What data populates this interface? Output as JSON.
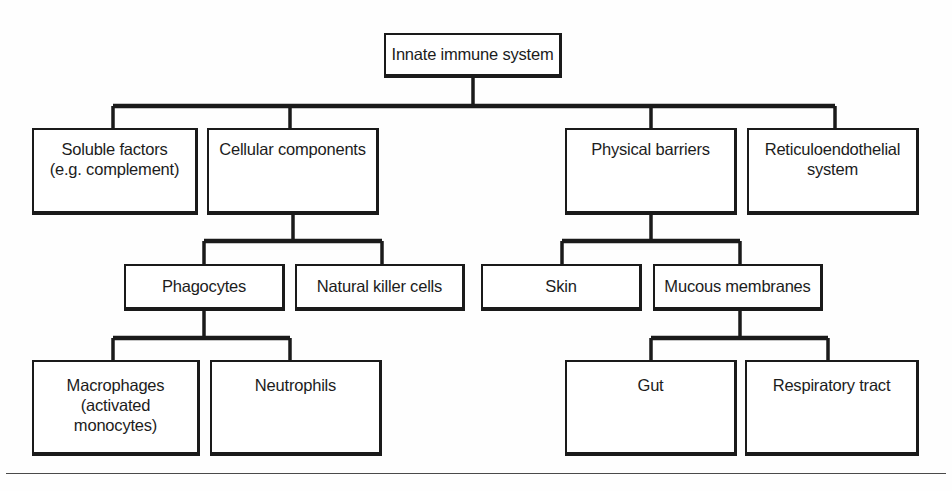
{
  "diagram": {
    "title": "Innate immune system",
    "type": "hierarchy-tree",
    "line_color": "#1a1a1a",
    "box_fill": "#ffffff",
    "text_color": "#1c1c1c",
    "nodes": {
      "root": "Innate immune system",
      "soluble_factors": "Soluble factors\n(e.g. complement)",
      "cellular_components": "Cellular components",
      "physical_barriers": "Physical barriers",
      "reticuloendothelial_system": "Reticuloendothelial\nsystem",
      "phagocytes": "Phagocytes",
      "natural_killer_cells": "Natural killer cells",
      "skin": "Skin",
      "mucous_membranes": "Mucous membranes",
      "macrophages": "Macrophages\n(activated monocytes)",
      "neutrophils": "Neutrophils",
      "gut": "Gut",
      "respiratory_tract": "Respiratory tract"
    },
    "edges": [
      {
        "from": "root",
        "to": "soluble_factors"
      },
      {
        "from": "root",
        "to": "cellular_components"
      },
      {
        "from": "root",
        "to": "physical_barriers"
      },
      {
        "from": "root",
        "to": "reticuloendothelial_system"
      },
      {
        "from": "cellular_components",
        "to": "phagocytes"
      },
      {
        "from": "cellular_components",
        "to": "natural_killer_cells"
      },
      {
        "from": "physical_barriers",
        "to": "skin"
      },
      {
        "from": "physical_barriers",
        "to": "mucous_membranes"
      },
      {
        "from": "phagocytes",
        "to": "macrophages"
      },
      {
        "from": "phagocytes",
        "to": "neutrophils"
      },
      {
        "from": "mucous_membranes",
        "to": "gut"
      },
      {
        "from": "mucous_membranes",
        "to": "respiratory_tract"
      }
    ]
  }
}
